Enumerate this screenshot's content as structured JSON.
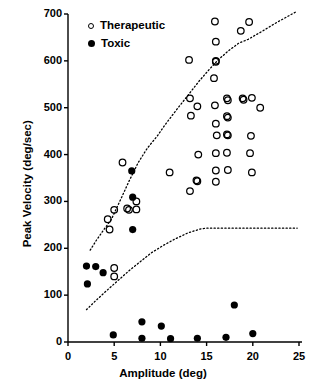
{
  "chart_data": {
    "type": "scatter",
    "title": "",
    "xlabel": "Amplitude (deg)",
    "ylabel": "Peak Velocity (deg/sec)",
    "xlim": [
      0,
      25
    ],
    "ylim": [
      0,
      700
    ],
    "xticks": [
      0,
      5,
      10,
      15,
      20,
      25
    ],
    "yticks": [
      0,
      100,
      200,
      300,
      400,
      500,
      600,
      700
    ],
    "grid": false,
    "legend_position": "top-left",
    "series": [
      {
        "name": "Therapeutic",
        "marker": "open-circle",
        "color": "#000000",
        "points": [
          [
            5.0,
            158
          ],
          [
            5.0,
            140
          ],
          [
            4.3,
            262
          ],
          [
            4.5,
            240
          ],
          [
            5.0,
            282
          ],
          [
            5.9,
            383
          ],
          [
            6.4,
            285
          ],
          [
            6.6,
            282
          ],
          [
            7.4,
            300
          ],
          [
            7.4,
            283
          ],
          [
            11.0,
            362
          ],
          [
            13.1,
            602
          ],
          [
            13.2,
            520
          ],
          [
            13.3,
            483
          ],
          [
            13.2,
            322
          ],
          [
            14.0,
            503
          ],
          [
            14.1,
            400
          ],
          [
            13.9,
            345
          ],
          [
            14.0,
            343
          ],
          [
            15.9,
            684
          ],
          [
            16.0,
            641
          ],
          [
            16.0,
            600
          ],
          [
            16.0,
            598
          ],
          [
            15.8,
            563
          ],
          [
            15.9,
            505
          ],
          [
            16.0,
            466
          ],
          [
            16.1,
            441
          ],
          [
            16.0,
            403
          ],
          [
            16.0,
            366
          ],
          [
            16.0,
            342
          ],
          [
            17.2,
            520
          ],
          [
            17.3,
            516
          ],
          [
            17.2,
            482
          ],
          [
            17.3,
            479
          ],
          [
            17.2,
            443
          ],
          [
            17.3,
            441
          ],
          [
            17.2,
            404
          ],
          [
            17.3,
            367
          ],
          [
            18.7,
            664
          ],
          [
            19.6,
            683
          ],
          [
            18.9,
            520
          ],
          [
            19.0,
            517
          ],
          [
            19.9,
            521
          ],
          [
            20.8,
            500
          ],
          [
            19.8,
            440
          ],
          [
            19.7,
            403
          ],
          [
            19.9,
            362
          ]
        ]
      },
      {
        "name": "Toxic",
        "marker": "filled-circle",
        "color": "#000000",
        "points": [
          [
            2.0,
            162
          ],
          [
            2.1,
            124
          ],
          [
            3.0,
            161
          ],
          [
            3.8,
            148
          ],
          [
            6.9,
            365
          ],
          [
            7.0,
            309
          ],
          [
            7.0,
            240
          ],
          [
            4.9,
            15
          ],
          [
            8.0,
            43
          ],
          [
            8.0,
            8
          ],
          [
            10.1,
            34
          ],
          [
            11.1,
            7
          ],
          [
            14.0,
            8
          ],
          [
            17.1,
            10
          ],
          [
            18.0,
            79
          ],
          [
            20.0,
            18
          ]
        ]
      }
    ],
    "annotations": [
      {
        "name": "upper-boundary-curve",
        "style": "dotted",
        "points": [
          [
            2.4,
            196
          ],
          [
            3.1,
            218
          ],
          [
            4.0,
            243
          ],
          [
            4.7,
            262
          ],
          [
            5.6,
            300
          ],
          [
            6.6,
            343
          ],
          [
            7.6,
            383
          ],
          [
            8.6,
            414
          ],
          [
            9.6,
            438
          ],
          [
            10.6,
            466
          ],
          [
            11.8,
            497
          ],
          [
            13.0,
            527
          ],
          [
            14.2,
            557
          ],
          [
            15.3,
            582
          ],
          [
            16.3,
            603
          ],
          [
            17.4,
            622
          ],
          [
            18.5,
            638
          ],
          [
            19.5,
            646
          ],
          [
            21.0,
            663
          ],
          [
            22.6,
            682
          ],
          [
            24.8,
            706
          ]
        ]
      },
      {
        "name": "lower-boundary-curve",
        "style": "dotted",
        "points": [
          [
            2.0,
            69
          ],
          [
            3.1,
            90
          ],
          [
            4.2,
            110
          ],
          [
            5.4,
            131
          ],
          [
            6.6,
            152
          ],
          [
            7.8,
            171
          ],
          [
            9.0,
            190
          ],
          [
            10.3,
            206
          ],
          [
            11.6,
            220
          ],
          [
            13.0,
            233
          ],
          [
            14.3,
            241
          ],
          [
            15.0,
            243
          ],
          [
            17.0,
            243
          ],
          [
            19.0,
            243
          ],
          [
            21.0,
            243
          ],
          [
            23.0,
            243
          ],
          [
            24.8,
            243
          ]
        ]
      }
    ]
  },
  "legend": {
    "therapeutic_label": "Therapeutic",
    "toxic_label": "Toxic"
  },
  "axes": {
    "x_title": "Amplitude (deg)",
    "y_title": "Peak Velocity (deg/sec)",
    "x_tick_labels": [
      "0",
      "5",
      "10",
      "15",
      "20",
      "25"
    ],
    "y_tick_labels": [
      "0",
      "100",
      "200",
      "300",
      "400",
      "500",
      "600",
      "700"
    ]
  }
}
